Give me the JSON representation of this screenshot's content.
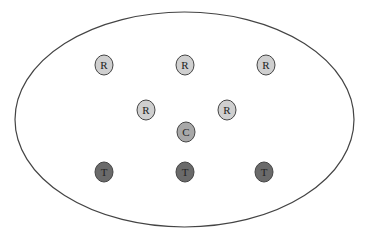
{
  "diagram": {
    "boundary": {
      "shape": "ellipse",
      "cx": 184.5,
      "cy": 119.5,
      "rx": 169.5,
      "ry": 107.5,
      "stroke": "#444444"
    },
    "colors": {
      "R": "#cfcfcf",
      "C": "#a8a8a8",
      "T": "#6a6a6a",
      "stroke": "#444444"
    },
    "nodes": [
      {
        "label": "R",
        "type": "R",
        "x": 104,
        "y": 65
      },
      {
        "label": "R",
        "type": "R",
        "x": 185,
        "y": 65
      },
      {
        "label": "R",
        "type": "R",
        "x": 266,
        "y": 65
      },
      {
        "label": "R",
        "type": "R",
        "x": 146,
        "y": 110
      },
      {
        "label": "R",
        "type": "R",
        "x": 227,
        "y": 110
      },
      {
        "label": "C",
        "type": "C",
        "x": 186,
        "y": 132
      },
      {
        "label": "T",
        "type": "T",
        "x": 104,
        "y": 172
      },
      {
        "label": "T",
        "type": "T",
        "x": 185,
        "y": 172
      },
      {
        "label": "T",
        "type": "T",
        "x": 264,
        "y": 172
      }
    ]
  }
}
